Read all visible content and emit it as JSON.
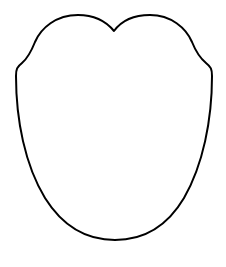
{
  "figure": {
    "canvas": {
      "width": 226,
      "height": 267,
      "background": "#ffffff"
    },
    "shape": {
      "name": "tongue-outline",
      "stroke": "#000000",
      "stroke_width": 2,
      "fill": "#ffffff",
      "key_points": {
        "top_notch": [
          114,
          31
        ],
        "left_lobe_peak": [
          78,
          15
        ],
        "right_lobe_peak": [
          150,
          15
        ],
        "left_shoulder": [
          18,
          70
        ],
        "right_shoulder": [
          210,
          70
        ],
        "bottom": [
          115,
          240
        ]
      }
    }
  }
}
